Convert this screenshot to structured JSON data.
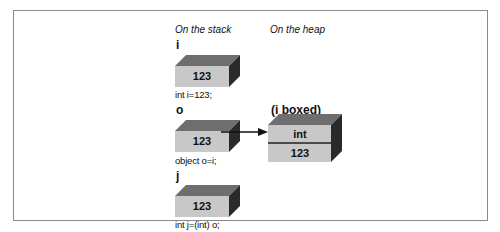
{
  "diagram": {
    "headers": {
      "stack": "On the stack",
      "heap": "On the heap"
    },
    "stack_items": [
      {
        "var": "i",
        "value": "123",
        "code": "int i=123;"
      },
      {
        "var": "o",
        "value": "123",
        "code": "object o=i;"
      },
      {
        "var": "j",
        "value": "123",
        "code": "int j=(int) o;"
      }
    ],
    "heap_object": {
      "title": "(i boxed)",
      "type_label": "int",
      "value": "123"
    },
    "arrow": {
      "from": "o",
      "to": "(i boxed)"
    },
    "colors": {
      "box_front": "#c8c8c8",
      "box_top": "#6e6e6e",
      "box_side": "#2a2a2a",
      "frame": "#8a8a8a"
    }
  }
}
